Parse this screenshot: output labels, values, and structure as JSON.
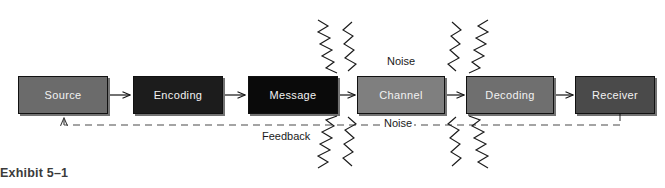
{
  "figure": {
    "caption": "Exhibit 5–1",
    "background_color": "#ffffff",
    "width": 665,
    "height": 188
  },
  "diagram": {
    "type": "process-flow",
    "nodes": [
      {
        "id": "source",
        "label": "Source",
        "fill": "#6b6b6b",
        "text_color": "#f2f2f2",
        "x": 18,
        "y": 76,
        "w": 90,
        "h": 38
      },
      {
        "id": "encoding",
        "label": "Encoding",
        "fill": "#1c1c1c",
        "text_color": "#f2f2f2",
        "x": 133,
        "y": 76,
        "w": 90,
        "h": 38
      },
      {
        "id": "message",
        "label": "Message",
        "fill": "#0a0a0a",
        "text_color": "#f2f2f2",
        "x": 248,
        "y": 76,
        "w": 90,
        "h": 38
      },
      {
        "id": "channel",
        "label": "Channel",
        "fill": "#7f7f7f",
        "text_color": "#f5f5f5",
        "x": 357,
        "y": 76,
        "w": 88,
        "h": 38
      },
      {
        "id": "decoding",
        "label": "Decoding",
        "fill": "#6f6f6f",
        "text_color": "#f2f2f2",
        "x": 466,
        "y": 76,
        "w": 88,
        "h": 38
      },
      {
        "id": "receiver",
        "label": "Receiver",
        "fill": "#4a4a4a",
        "text_color": "#f2f2f2",
        "x": 575,
        "y": 76,
        "w": 80,
        "h": 38
      }
    ],
    "connectors": [
      {
        "id": "source-to-encoding",
        "from": "source",
        "to": "encoding",
        "style": "solid-arrow"
      },
      {
        "id": "encoding-to-message",
        "from": "encoding",
        "to": "message",
        "style": "solid-arrow"
      },
      {
        "id": "message-to-channel",
        "from": "message",
        "to": "channel",
        "style": "solid-arrow"
      },
      {
        "id": "channel-to-decoding",
        "from": "channel",
        "to": "decoding",
        "style": "solid-arrow"
      },
      {
        "id": "decoding-to-receiver",
        "from": "decoding",
        "to": "receiver",
        "style": "solid-arrow"
      }
    ],
    "feedback_loop": {
      "label": "Feedback",
      "style": "dashed",
      "from": "receiver",
      "to": "source",
      "label_x": 262,
      "label_y": 130
    },
    "noise_labels": [
      {
        "id": "noise-top",
        "label": "Noise",
        "x": 385,
        "y": 55
      },
      {
        "id": "noise-bottom",
        "label": "Noise",
        "x": 382,
        "y": 117
      }
    ],
    "noise_source": "channel",
    "noise_bolt_count": 8,
    "colors": {
      "line": "#1a1a1a",
      "dashed_line": "#5a5a5a",
      "text": "#1a1a1a",
      "caption": "#3b3b3b"
    }
  }
}
